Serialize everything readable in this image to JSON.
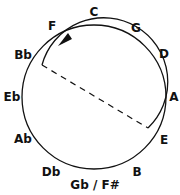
{
  "diagram": {
    "colors": {
      "stroke": "#111111",
      "background": "#ffffff"
    },
    "labels": [
      {
        "key": "c",
        "text": "C",
        "x": 94,
        "y": 12
      },
      {
        "key": "g",
        "text": "G",
        "x": 136,
        "y": 28
      },
      {
        "key": "d",
        "text": "D",
        "x": 164,
        "y": 54
      },
      {
        "key": "a",
        "text": "A",
        "x": 174,
        "y": 97
      },
      {
        "key": "e",
        "text": "E",
        "x": 164,
        "y": 140
      },
      {
        "key": "b",
        "text": "B",
        "x": 137,
        "y": 172
      },
      {
        "key": "gb",
        "text": "Gb / F#",
        "x": 95,
        "y": 185
      },
      {
        "key": "db",
        "text": "Db",
        "x": 51,
        "y": 172
      },
      {
        "key": "ab",
        "text": "Ab",
        "x": 23,
        "y": 139
      },
      {
        "key": "eb",
        "text": "Eb",
        "x": 12,
        "y": 97
      },
      {
        "key": "bb",
        "text": "Bb",
        "x": 23,
        "y": 55
      },
      {
        "key": "f",
        "text": "F",
        "x": 52,
        "y": 26
      }
    ],
    "arrow_direction": "counter-clockwise"
  }
}
